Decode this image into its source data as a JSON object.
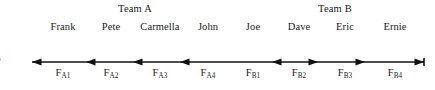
{
  "figure": {
    "number_label": "6",
    "caption": ""
  },
  "teams": [
    {
      "id": "A",
      "label": "Team A",
      "center_x": 135,
      "direction": "left"
    },
    {
      "id": "B",
      "label": "Team B",
      "center_x": 335,
      "direction": "right"
    }
  ],
  "members": [
    {
      "name": "Frank",
      "team": "A",
      "x": 63
    },
    {
      "name": "Pete",
      "team": "A",
      "x": 111
    },
    {
      "name": "Carmella",
      "team": "A",
      "x": 160
    },
    {
      "name": "John",
      "team": "A",
      "x": 208
    },
    {
      "name": "Joe",
      "team": "B",
      "x": 253
    },
    {
      "name": "Dave",
      "team": "B",
      "x": 299
    },
    {
      "name": "Eric",
      "team": "B",
      "x": 345
    },
    {
      "name": "Ernie",
      "team": "B",
      "x": 395
    }
  ],
  "forces": [
    {
      "base": "F",
      "subscript": "A1",
      "x": 63,
      "direction": "left"
    },
    {
      "base": "F",
      "subscript": "A2",
      "x": 111,
      "direction": "left"
    },
    {
      "base": "F",
      "subscript": "A3",
      "x": 160,
      "direction": "left"
    },
    {
      "base": "F",
      "subscript": "A4",
      "x": 208,
      "direction": "left"
    },
    {
      "base": "F",
      "subscript": "B1",
      "x": 253,
      "direction": "left"
    },
    {
      "base": "F",
      "subscript": "B2",
      "x": 299,
      "direction": "right"
    },
    {
      "base": "F",
      "subscript": "B3",
      "x": 345,
      "direction": "right"
    },
    {
      "base": "F",
      "subscript": "B4",
      "x": 395,
      "direction": "right"
    }
  ],
  "axis": {
    "y": 62,
    "x_start": 32,
    "x_end": 424,
    "arrowhead_positions": [
      32,
      86,
      133,
      180,
      272,
      318,
      365,
      424
    ],
    "color": "#111111",
    "line_width": 1.6
  },
  "style": {
    "text_color": "#1a1a1a",
    "background": "#ffffff",
    "line_color": "#111111"
  }
}
